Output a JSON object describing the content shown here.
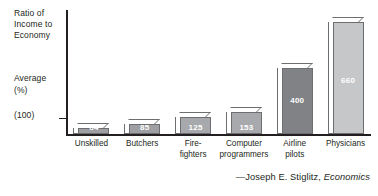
{
  "axis": {
    "y_title": "Ratio of\nIncome to\nEconomy",
    "average_label": "Average",
    "percent_label": "(%)",
    "baseline_label": "(100)"
  },
  "attribution": {
    "dash_author": "—Joseph E. Stiglitz,",
    "work": "Economics"
  },
  "chart_data": {
    "type": "bar",
    "title": "Ratio of Income to Economy Average (%)",
    "xlabel": "",
    "ylabel": "Ratio of Income to Economy Average (%)",
    "ylim": [
      0,
      700
    ],
    "grid": false,
    "legend": "none",
    "baseline": 100,
    "baseline_tick_label": "(100)",
    "categories": [
      "Unskilled",
      "Butchers",
      "Fire-\nfighters",
      "Computer\nprogrammers",
      "Airline\npilots",
      "Physicians"
    ],
    "values": [
      64,
      85,
      125,
      153,
      400,
      660
    ],
    "value_labels": [
      "64",
      "85",
      "125",
      "153",
      "400",
      "660"
    ],
    "bar_colors": [
      "#9d9fa2",
      "#9d9fa2",
      "#a7a9ac",
      "#a7a9ac",
      "#808285",
      "#c6c7c9"
    ]
  }
}
